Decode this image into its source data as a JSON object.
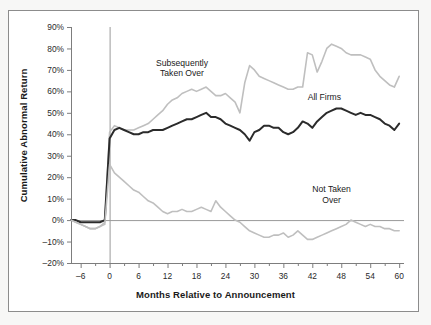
{
  "figure": {
    "background": "#f7f7f6",
    "panel_background": "#ffffff",
    "frame_color": "#8c8c8c"
  },
  "chart_data": {
    "type": "line",
    "title": "",
    "xlabel": "Months Relative to Announcement",
    "ylabel": "Cumulative Abnormal Return",
    "xlim": [
      -8,
      61
    ],
    "ylim": [
      -20,
      90
    ],
    "xticks": [
      -6,
      0,
      6,
      12,
      18,
      24,
      30,
      36,
      42,
      48,
      54,
      60
    ],
    "xtick_labels": [
      "–6",
      "0",
      "6",
      "12",
      "18",
      "24",
      "30",
      "36",
      "42",
      "48",
      "54",
      "60"
    ],
    "yticks": [
      -20,
      -10,
      0,
      10,
      20,
      30,
      40,
      50,
      60,
      70,
      80,
      90
    ],
    "ytick_labels": [
      "–20%",
      "–10%",
      "0%",
      "10%",
      "20%",
      "30%",
      "40%",
      "50%",
      "60%",
      "70%",
      "80%",
      "90%"
    ],
    "grid": false,
    "legend_position": "inline-annotations",
    "reference_lines": [
      {
        "name": "zero-return-line",
        "axis": "horizontal",
        "value": 0,
        "color": "#9a9a9a"
      },
      {
        "name": "announcement-line",
        "axis": "vertical",
        "value": 0,
        "color": "#9a9a9a"
      }
    ],
    "annotations": [
      {
        "name": "subsequently-taken-over-label",
        "text": "Subsequently\nTaken Over",
        "x": 15,
        "y": 72
      },
      {
        "name": "all-firms-label",
        "text": "All Firms",
        "x": 44.5,
        "y": 56
      },
      {
        "name": "not-taken-over-label",
        "text": "Not Taken\nOver",
        "x": 46,
        "y": 13
      }
    ],
    "series": [
      {
        "name": "Subsequently Taken Over",
        "color": "#bfbfbf",
        "width": 1.6,
        "x": [
          -8,
          -7,
          -6,
          -5,
          -4,
          -3,
          -2,
          -1,
          0,
          1,
          2,
          3,
          4,
          5,
          6,
          7,
          8,
          9,
          10,
          11,
          12,
          13,
          14,
          15,
          16,
          17,
          18,
          19,
          20,
          21,
          22,
          23,
          24,
          25,
          26,
          27,
          28,
          29,
          30,
          31,
          32,
          33,
          34,
          35,
          36,
          37,
          38,
          39,
          40,
          41,
          42,
          43,
          44,
          45,
          46,
          47,
          48,
          49,
          50,
          51,
          52,
          53,
          54,
          55,
          56,
          57,
          58,
          59,
          60
        ],
        "values": [
          0,
          -1,
          -2,
          -3,
          -4,
          -4,
          -3,
          -1,
          41,
          44,
          43,
          42,
          42,
          42,
          43,
          44,
          45,
          47,
          49,
          51,
          54,
          56,
          57,
          59,
          60,
          61,
          60,
          61,
          62,
          60,
          58,
          58,
          59,
          57,
          55,
          50,
          64,
          72,
          70,
          67,
          66,
          65,
          64,
          63,
          62,
          61,
          61,
          62,
          62,
          78,
          77,
          69,
          74,
          80,
          82,
          81,
          80,
          78,
          77,
          77,
          77,
          76,
          75,
          70,
          67,
          65,
          63,
          62,
          67
        ]
      },
      {
        "name": "All Firms",
        "color": "#2b2b2b",
        "width": 2.0,
        "x": [
          -8,
          -7,
          -6,
          -5,
          -4,
          -3,
          -2,
          -1,
          0,
          1,
          2,
          3,
          4,
          5,
          6,
          7,
          8,
          9,
          10,
          11,
          12,
          13,
          14,
          15,
          16,
          17,
          18,
          19,
          20,
          21,
          22,
          23,
          24,
          25,
          26,
          27,
          28,
          29,
          30,
          31,
          32,
          33,
          34,
          35,
          36,
          37,
          38,
          39,
          40,
          41,
          42,
          43,
          44,
          45,
          46,
          47,
          48,
          49,
          50,
          51,
          52,
          53,
          54,
          55,
          56,
          57,
          58,
          59,
          60
        ],
        "values": [
          0,
          0,
          -1,
          -1,
          -1,
          -1,
          -1,
          0,
          38,
          42,
          43,
          42,
          41,
          40,
          40,
          41,
          41,
          42,
          42,
          42,
          43,
          44,
          45,
          46,
          47,
          47,
          48,
          49,
          50,
          48,
          48,
          47,
          45,
          44,
          43,
          42,
          40,
          37,
          41,
          42,
          44,
          44,
          43,
          43,
          41,
          40,
          41,
          43,
          46,
          45,
          43,
          46,
          48,
          50,
          51,
          52,
          52,
          51,
          50,
          49,
          50,
          49,
          49,
          48,
          47,
          45,
          44,
          42,
          45
        ]
      },
      {
        "name": "Not Taken Over",
        "color": "#bfbfbf",
        "width": 1.6,
        "x": [
          -8,
          -7,
          -6,
          -5,
          -4,
          -3,
          -2,
          -1,
          0,
          1,
          2,
          3,
          4,
          5,
          6,
          7,
          8,
          9,
          10,
          11,
          12,
          13,
          14,
          15,
          16,
          17,
          18,
          19,
          20,
          21,
          22,
          23,
          24,
          25,
          26,
          27,
          28,
          29,
          30,
          31,
          32,
          33,
          34,
          35,
          36,
          37,
          38,
          39,
          40,
          41,
          42,
          43,
          44,
          45,
          46,
          47,
          48,
          49,
          50,
          51,
          52,
          53,
          54,
          55,
          56,
          57,
          58,
          59,
          60
        ],
        "values": [
          0,
          -1,
          -2,
          -3,
          -4,
          -4,
          -3,
          -2,
          26,
          22,
          20,
          18,
          16,
          14,
          13,
          11,
          9,
          8,
          6,
          4,
          3,
          4,
          4,
          5,
          4,
          4,
          5,
          6,
          5,
          4,
          9,
          6,
          4,
          2,
          0,
          -1,
          -3,
          -5,
          -6,
          -7,
          -8,
          -8,
          -7,
          -7,
          -6,
          -8,
          -7,
          -5,
          -7,
          -9,
          -9,
          -8,
          -7,
          -6,
          -5,
          -4,
          -3,
          -2,
          0,
          -1,
          -2,
          -3,
          -2,
          -3,
          -3,
          -4,
          -4,
          -5,
          -5
        ]
      }
    ]
  }
}
